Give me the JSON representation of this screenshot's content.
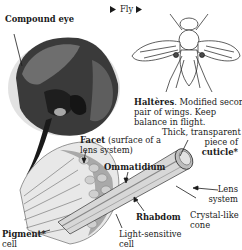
{
  "diagram": {
    "labels": {
      "compound_eye": "Compound eye",
      "fly": "Fly",
      "halteres_term": "Haltères",
      "halteres_desc_1": ". Modified second",
      "halteres_desc_2": "pair of wings. Keep",
      "halteres_desc_3": "balance in flight.",
      "facet_term": "Facet",
      "facet_desc_1": " (surface of a",
      "facet_desc_2": "lens system)",
      "ommatidium": "Ommatidium",
      "cuticle_1": "Thick, transparent",
      "cuticle_2": "piece of",
      "cuticle_term": "cuticle*",
      "lens_1": "Lens",
      "lens_2": "system",
      "cone_1": "Crystal-like",
      "cone_2": "cone",
      "rhabdom": "Rhabdom",
      "light_1": "Light-sensitive",
      "light_2": "cell",
      "pigment_term": "Pigment*",
      "pigment_2": "cell"
    },
    "colors": {
      "text": "#1a1a1a",
      "eye_dark": "#2b2b2b",
      "eye_mid": "#6a6a6a",
      "shade_light": "#d9d9d9"
    }
  }
}
